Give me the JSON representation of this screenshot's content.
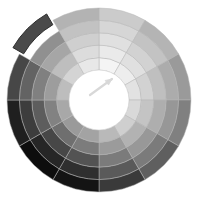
{
  "figure": {
    "kind": "polar-wheel",
    "background_color": "#ffffff",
    "width": 199,
    "height": 201
  },
  "geometry": {
    "center_x": 99,
    "center_y": 100,
    "outer_radius": 92,
    "hub_radius": 30,
    "ring_count": 5,
    "sector_count": 12,
    "sector_degrees": 30,
    "start_angle_deg": -90,
    "stroke_color": "#b4b4b4",
    "stroke_width": 0.5
  },
  "hub": {
    "fill_color": "#ffffff",
    "edge_color": "#cfcfcf",
    "marker": {
      "name": "needle-arrow",
      "color": "#d8d8d8",
      "tip_x": 112,
      "tip_y": 79,
      "tail_x": 90,
      "tail_y": 95,
      "stroke_width": 2.2
    }
  },
  "explode": {
    "sector_index": 10,
    "ring_index": 4,
    "offset_px": 9,
    "fill_color": "#4a4a4a",
    "edge_color": "#2e2e2e"
  },
  "chart_data": {
    "type": "pie",
    "title": "",
    "subtitle": "",
    "xlabel": "",
    "ylabel": "",
    "grid": false,
    "legend_position": "none",
    "angular_axis": {
      "units": "degrees",
      "range": [
        0,
        360
      ],
      "tick_labels": []
    },
    "radial_axis": {
      "label": "ring",
      "range": [
        1,
        5
      ],
      "tick_labels": [
        "1",
        "2",
        "3",
        "4",
        "5"
      ]
    },
    "categories": [
      "000",
      "030",
      "060",
      "090",
      "120",
      "150",
      "180",
      "210",
      "240",
      "270",
      "300",
      "330"
    ],
    "series": [
      {
        "name": "ring-1",
        "values": [
          "#f4f4f4",
          "#ededed",
          "#e2e2e2",
          "#d9d9d9",
          "#cfcfcf",
          "#b9b9b9",
          "#a3a3a3",
          "#9a9a9a",
          "#a8a8a8",
          "#bdbdbd",
          "#d4d4d4",
          "#e8e8e8"
        ]
      },
      {
        "name": "ring-2",
        "values": [
          "#eaeaea",
          "#e0e0e0",
          "#d2d2d2",
          "#c4c4c4",
          "#b2b2b2",
          "#9b9b9b",
          "#7c7c7c",
          "#6f6f6f",
          "#828282",
          "#9d9d9d",
          "#bebebe",
          "#dcdcdc"
        ]
      },
      {
        "name": "ring-3",
        "values": [
          "#e0e0e0",
          "#d2d2d2",
          "#bfbfbf",
          "#aeaeae",
          "#989898",
          "#7b7b7b",
          "#535353",
          "#474747",
          "#5d5d5d",
          "#808080",
          "#a6a6a6",
          "#cfcfcf"
        ]
      },
      {
        "name": "ring-4",
        "values": [
          "#d6d6d6",
          "#c3c3c3",
          "#acacac",
          "#979797",
          "#7b7b7b",
          "#5a5a5a",
          "#2f2f2f",
          "#262626",
          "#3d3d3d",
          "#636363",
          "#909090",
          "#c2c2c2"
        ]
      },
      {
        "name": "ring-5",
        "values": [
          "#cbcbcb",
          "#b4b4b4",
          "#9a9a9a",
          "#808080",
          "#5f5f5f",
          "#3a3a3a",
          "#141414",
          "#0d0d0d",
          "#1f1f1f",
          "#474747",
          "#4a4a4a",
          "#b3b3b3"
        ]
      }
    ]
  }
}
